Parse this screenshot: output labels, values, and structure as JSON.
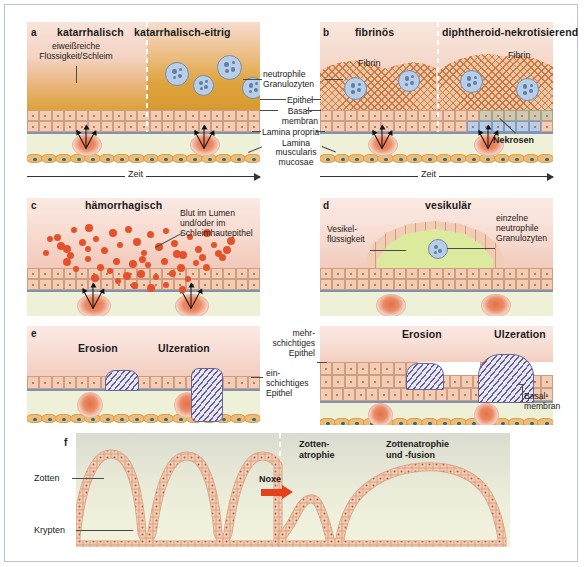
{
  "figure": {
    "title_caption": "",
    "panels": [
      {
        "letter": "a",
        "left_title": "katarrhalisch",
        "right_title": "katarrhalisch-eitrig",
        "labels": {
          "exudate": "eiweißreiche\nFlüssigkeit/Schleim",
          "time_axis": "Zeit"
        }
      },
      {
        "letter": "b",
        "left_title": "fibrinös",
        "right_title": "diphtheroid-nekrotisierend",
        "labels": {
          "fibrin_left": "Fibrin",
          "fibrin_right": "Fibrin",
          "necrosis": "Nekrosen",
          "time_axis": "Zeit"
        }
      },
      {
        "letter": "c",
        "title": "hämorrhagisch",
        "labels": {
          "blood": "Blut im Lumen\nund/oder im\nSchleimhautepithel"
        }
      },
      {
        "letter": "d",
        "title": "vesikulär",
        "labels": {
          "vesicle_fluid": "Vesikel-\nflüssigkeit",
          "single_neutrophils": "einzelne\nneutrophile\nGranulozyten"
        }
      },
      {
        "letter": "e",
        "left_labels": {
          "erosion": "Erosion",
          "ulceration": "Ulzeration"
        },
        "right_labels": {
          "erosion": "Erosion",
          "ulceration": "Ulzeration"
        },
        "center_labels": {
          "stratified": "mehr-\nschichtiges\nEpithel",
          "simple": "ein-\nschichtiges\nEpithel"
        },
        "right_side_labels": {
          "basal_membrane": "Basal-\nmembran"
        }
      },
      {
        "letter": "f",
        "labels": {
          "villi": "Zotten",
          "crypts": "Krypten",
          "noxe": "Noxe",
          "villus_atrophy": "Zotten-\natrophie",
          "atrophy_fusion": "Zottenatrophie\nund -fusion"
        }
      }
    ],
    "shared_legend": {
      "neutrophile_granulozyten": "neutrophile\nGranulozyten",
      "epithel": "Epithel",
      "basalmembran": "Basal-\nmembran",
      "lamina_propria": "Lamina propria",
      "lamina_muscularis_mucosae": "Lamina\nmuscularis\nmucosae"
    },
    "colors": {
      "frame_border": "#b9c6d2",
      "lumen_pink": "#f6dcd2",
      "lumen_orange": "#e2a63f",
      "lamina_propria_green": "#eef0d8",
      "epithelium_cell": "#f2cdb4",
      "epithelium_border": "#cf9d83",
      "basal_membrane": "#7d93b5",
      "muscularis": "#eebc76",
      "muscularis_nucleus": "#2e6f80",
      "neutrophil_cytoplasm": "#b9cde6",
      "neutrophil_nucleus": "#5d7fa8",
      "erythrocyte": "#e4512a",
      "fibrin_hatch": "#c46e3c",
      "ulcer_hatch": "#5c5696",
      "noxe_arrow": "#e3401c",
      "necrosis_cell": "#b9cde6",
      "vesicle_fluid": "#d9e8a8",
      "text": "#1b1b1b"
    }
  }
}
